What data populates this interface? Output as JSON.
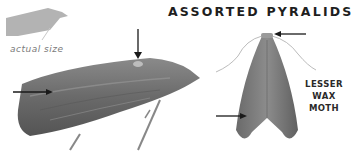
{
  "figure": {
    "title": "ASSORTED PYRALIDS",
    "actual_size_caption": "actual size",
    "species_label_line1": "LESSER",
    "species_label_line2": "WAX MOTH"
  },
  "colors": {
    "silhouette": "#b3b3b3",
    "moth_body": "#6e6e6e",
    "moth_dark": "#4a4a4a",
    "arrow": "#1a1a1a",
    "text": "#1e1e1e"
  },
  "icons": {
    "silhouette": "moth-silhouette-icon",
    "side_view": "moth-side-view-illustration",
    "top_view": "moth-top-view-illustration",
    "arrows": [
      "arrow-down-icon",
      "arrow-right-icon",
      "arrow-left-icon",
      "arrow-right-icon"
    ]
  }
}
